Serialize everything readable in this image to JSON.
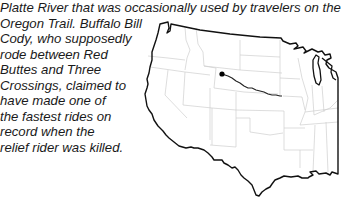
{
  "document": {
    "caption_lines": [
      "Platte River that was occasionally used by travelers on the",
      "Oregon Trail. Buffalo Bill",
      "Cody, who supposedly",
      "rode between Red",
      "Buttes and Three",
      "Crossings, claimed to",
      "have made one of",
      "the fastest rides on",
      "record when the",
      "relief rider was killed."
    ]
  },
  "figure": {
    "type": "map",
    "marker": "start-point-dot",
    "route": "trail-line",
    "colors": {
      "outline": "#111111",
      "state_borders": "#c8c8c8",
      "route": "#222222",
      "marker": "#000000"
    }
  }
}
